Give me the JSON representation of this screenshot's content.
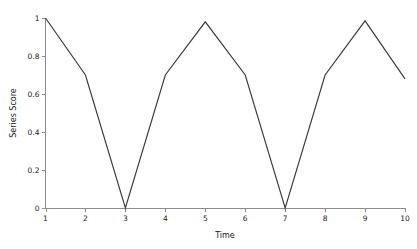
{
  "chart_data": {
    "type": "line",
    "title": "",
    "xlabel": "Time",
    "ylabel": "Series Score",
    "x": [
      1,
      2,
      3,
      4,
      5,
      6,
      7,
      8,
      9,
      10
    ],
    "values": [
      1.0,
      0.7,
      0.0,
      0.7,
      0.98,
      0.7,
      0.0,
      0.7,
      0.985,
      0.68
    ],
    "series": [
      {
        "name": "Series Score",
        "values": [
          1.0,
          0.7,
          0.0,
          0.7,
          0.98,
          0.7,
          0.0,
          0.7,
          0.985,
          0.68
        ]
      }
    ],
    "xlim": [
      1,
      10
    ],
    "ylim": [
      0,
      1
    ],
    "xticks": [
      1,
      2,
      3,
      4,
      5,
      6,
      7,
      8,
      9,
      10
    ],
    "xtick_labels": [
      "1",
      "2",
      "3",
      "4",
      "5",
      "6",
      "7",
      "8",
      "9",
      "10"
    ],
    "yticks": [
      0,
      0.2,
      0.4,
      0.6,
      0.8,
      1
    ],
    "ytick_labels": [
      "0",
      "0.2",
      "0.4",
      "0.6",
      "0.8",
      "1"
    ],
    "grid": false,
    "legend": false,
    "legend_position": "none",
    "line_color": "#3a3a3a",
    "axis_color": "#8c8c8c",
    "background_color": "#ffffff",
    "annotations": []
  }
}
